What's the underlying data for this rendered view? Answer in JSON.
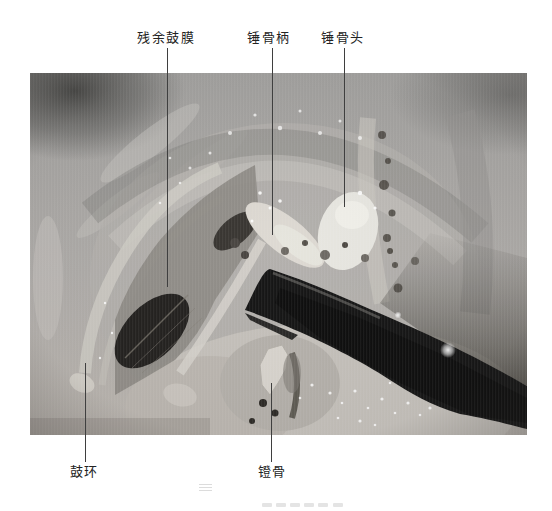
{
  "figure": {
    "top_labels": [
      {
        "text": "残余鼓膜"
      },
      {
        "text": "锤骨柄"
      },
      {
        "text": "锤骨头"
      }
    ],
    "bottom_labels": [
      {
        "text": "鼓环"
      },
      {
        "text": "镫骨"
      }
    ]
  },
  "palette": {
    "page_bg": "#ffffff",
    "label_text": "#232323",
    "leader_line": "#3f3f3f",
    "tissue_base_top": "#a3a2a0",
    "tissue_base_bottom": "#bdb8b2",
    "tissue_light": "#c8c4be",
    "membrane_gray": "#8f8c87",
    "cavity_dark": "#242220",
    "bone_white": "#e8e7e1",
    "bone_soft": "#ddd9d2",
    "instrument_dark": "#161616"
  }
}
